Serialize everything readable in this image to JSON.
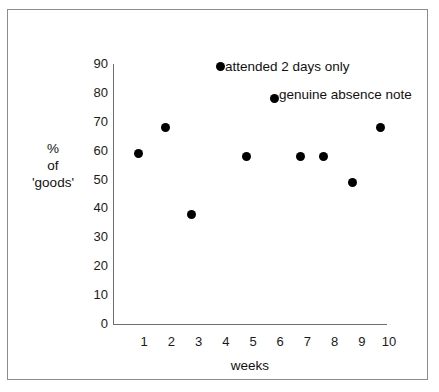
{
  "chart_data": {
    "type": "scatter",
    "title": "",
    "xlabel": "weeks",
    "ylabel": "% of 'goods'",
    "ylabel_lines": [
      "%",
      "of",
      "'goods'"
    ],
    "xlim": [
      0,
      10.5
    ],
    "ylim": [
      0,
      90
    ],
    "xticks": [
      "1",
      "2",
      "3",
      "4",
      "5",
      "6",
      "7",
      "8",
      "9",
      "10"
    ],
    "yticks": [
      "0",
      "10",
      "20",
      "30",
      "40",
      "50",
      "60",
      "70",
      "80",
      "90"
    ],
    "grid": false,
    "legend": "none",
    "marker_color": "#000000",
    "axis_color": "#6e6e6e",
    "points": [
      {
        "x": 0.8,
        "y": 59
      },
      {
        "x": 1.8,
        "y": 68
      },
      {
        "x": 2.75,
        "y": 38
      },
      {
        "x": 3.8,
        "y": 89,
        "annotation": "attended 2 days only"
      },
      {
        "x": 4.75,
        "y": 58
      },
      {
        "x": 5.8,
        "y": 78,
        "annotation": "genuine absence note"
      },
      {
        "x": 6.75,
        "y": 58
      },
      {
        "x": 7.6,
        "y": 58
      },
      {
        "x": 8.65,
        "y": 49
      },
      {
        "x": 9.7,
        "y": 68
      }
    ],
    "annotations": [
      {
        "text": "attended 2 days only",
        "x": 225,
        "y": 60
      },
      {
        "text": "genuine absence note",
        "x": 279,
        "y": 88
      }
    ]
  }
}
